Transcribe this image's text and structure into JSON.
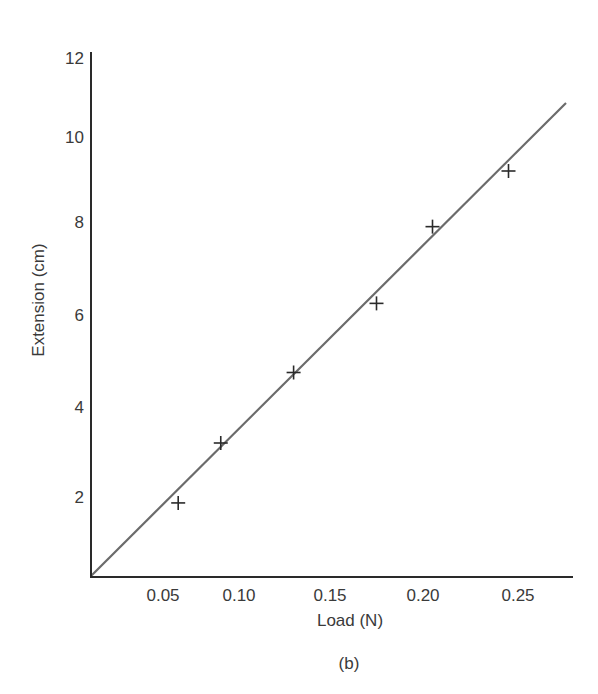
{
  "chart_data": {
    "type": "scatter",
    "title": "",
    "caption": "(b)",
    "xlabel": "Load (N)",
    "ylabel": "Extension (cm)",
    "xlim": [
      0,
      0.28
    ],
    "ylim": [
      0,
      12
    ],
    "x_ticks": [
      0.05,
      0.1,
      0.15,
      0.2,
      0.25
    ],
    "x_tick_labels": [
      "0.05",
      "0.10",
      "0.15",
      "0.20",
      "0.25"
    ],
    "y_ticks": [
      2,
      4,
      6,
      8,
      10,
      12
    ],
    "y_tick_labels": [
      "2",
      "4",
      "6",
      "8",
      "10",
      "12"
    ],
    "grid": false,
    "legend": null,
    "series": [
      {
        "name": "measurements",
        "marker": "+",
        "x": [
          0.06,
          0.088,
          0.13,
          0.175,
          0.205,
          0.245
        ],
        "y": [
          1.85,
          3.2,
          4.75,
          6.25,
          7.9,
          9.2
        ]
      },
      {
        "name": "best-fit line",
        "type": "line",
        "x": [
          0.0,
          0.28
        ],
        "y": [
          0.0,
          10.8
        ]
      }
    ],
    "colors": {
      "axis": "#2a2a2a",
      "line": "#6b6b6b",
      "marker": "#2a2a2a",
      "text": "#3a3a3a"
    }
  }
}
